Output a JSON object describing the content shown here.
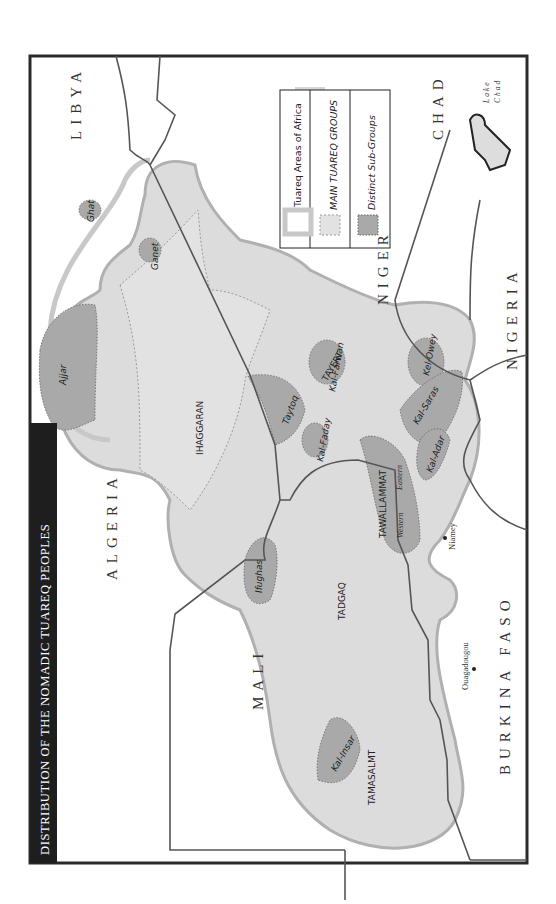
{
  "title": "DISTRIBUTION OF THE NOMADIC TUAREQ PEOPLES",
  "orientation": "rotated 90° counter-clockwise (north points left)",
  "colors": {
    "frame": "#2a2a2a",
    "tuareq_area": "#dcdcdc",
    "tuareq_outline": "#b0b0b0",
    "main_group": "#e2e2e2",
    "sub_group": "#a9a9a9",
    "border": "#555555",
    "title_bg": "#1e1e1e"
  },
  "legend": {
    "items": [
      {
        "label": "Tuareq Areas of Africa",
        "style": "tuareq-area"
      },
      {
        "label": "MAIN TUAREQ GROUPS",
        "style": "main-group"
      },
      {
        "label": "Distinct Sub-Groups",
        "style": "sub-group"
      }
    ]
  },
  "countries": {
    "libya": "LIBYA",
    "algeria": "ALGERIA",
    "mali": "MALI",
    "niger": "NIGER",
    "chad": "CHAD",
    "nigeria": "NIGERIA",
    "burkina_faso": "BURKINA FASO"
  },
  "water": {
    "lake_chad_1": "Lake",
    "lake_chad_2": "Chad"
  },
  "cities": {
    "niamey": "Niamey",
    "ouagadougou": "Ouagadougou"
  },
  "main_groups": {
    "ihaggaran": "IHAGGARAN",
    "tayert": "TAYERT",
    "tawallammat": "TAWALLAMMAT",
    "tadgaq": "TADGAQ",
    "tamasalmt": "TAMASALMT"
  },
  "sub_groups": {
    "ajjar": "Ajjar",
    "ghat": "Ghat",
    "ganet": "Ganet",
    "taytoq": "Taytoq",
    "kal_faday": "Kal-Faday",
    "kal_farwan": "Kal-Farwan",
    "kel_owey": "Kel-Owey",
    "kal_saras": "Kal-Saras",
    "kal_adar": "Kal-Adar",
    "ifughas": "Ifughas",
    "kal_insar": "Kal-Insar"
  },
  "divisions": {
    "western": "Western",
    "eastern": "Eastern"
  }
}
